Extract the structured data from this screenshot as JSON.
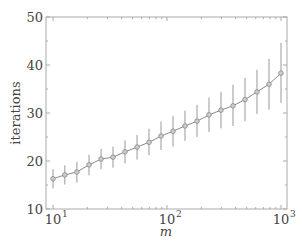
{
  "chart_data": {
    "type": "line",
    "title": "",
    "xlabel": "m",
    "ylabel": "iterations",
    "xscale": "log",
    "xlim": [
      10,
      1000
    ],
    "ylim": [
      10,
      50
    ],
    "x_ticks": [
      "10^1",
      "10^2",
      "10^3"
    ],
    "y_ticks": [
      10,
      20,
      30,
      40,
      50
    ],
    "grid": false,
    "legend": null,
    "series": [
      {
        "name": "iterations",
        "marker": "circle",
        "color": "#8a8a8a",
        "x": [
          10,
          12.7,
          16.2,
          20.7,
          26.4,
          33.6,
          42.8,
          54.6,
          69.5,
          88.6,
          112.9,
          143.8,
          183.3,
          233.6,
          297.6,
          379.3,
          483.3,
          615.8,
          784.8,
          1000
        ],
        "values": [
          16.3,
          17.1,
          17.7,
          19.2,
          20.4,
          20.8,
          21.9,
          22.9,
          23.9,
          25.2,
          26.2,
          27.3,
          28.3,
          29.6,
          30.6,
          31.5,
          32.8,
          34.4,
          36.0,
          38.3
        ],
        "error_low": [
          14.3,
          15.1,
          15.5,
          17.0,
          18.3,
          18.6,
          19.5,
          20.3,
          21.2,
          22.3,
          23.0,
          24.2,
          25.0,
          26.0,
          26.8,
          27.3,
          28.3,
          29.8,
          30.7,
          32.1
        ],
        "error_high": [
          18.3,
          19.1,
          19.8,
          21.3,
          22.5,
          23.0,
          24.3,
          25.4,
          26.7,
          28.2,
          29.4,
          30.5,
          31.7,
          33.2,
          34.4,
          35.9,
          37.3,
          39.0,
          41.3,
          44.6
        ]
      }
    ]
  },
  "labels": {
    "ylabel": "iterations",
    "xlabel": "m",
    "y_ticks": [
      "10",
      "20",
      "30",
      "40",
      "50"
    ],
    "x_base": "10",
    "x_exps": [
      "1",
      "2",
      "3"
    ]
  }
}
